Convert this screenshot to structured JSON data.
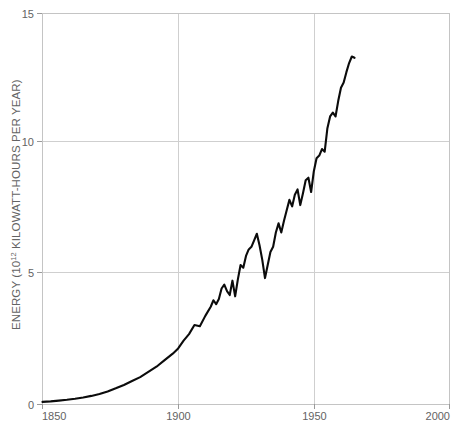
{
  "chart_data": {
    "type": "line",
    "title": "",
    "subtitle": "",
    "xlabel": "",
    "ylabel": "ENERGY (10",
    "ylabel_exponent": "12",
    "ylabel_tail": " KILOWATT-HOURS PER YEAR)",
    "ylabel_full": "ENERGY (10^12 KILOWATT-HOURS PER YEAR)",
    "grid": true,
    "legend": "none",
    "xlim": [
      1850,
      2000
    ],
    "ylim": [
      0,
      15
    ],
    "xticks": [
      1850,
      1900,
      1950,
      2000
    ],
    "xtick_labels": [
      "1850",
      "1900",
      "1950",
      "2000"
    ],
    "yticks": [
      0,
      5,
      10,
      15
    ],
    "ytick_labels": [
      "0",
      "5",
      "10",
      "15"
    ],
    "series": [
      {
        "name": "World energy consumption",
        "color": "#0b0b0b",
        "x": [
          1850,
          1853,
          1856,
          1859,
          1862,
          1865,
          1868,
          1871,
          1874,
          1877,
          1880,
          1883,
          1886,
          1889,
          1892,
          1895,
          1898,
          1900,
          1902,
          1904,
          1906,
          1908,
          1910,
          1912,
          1913,
          1914,
          1915,
          1916,
          1917,
          1918,
          1919,
          1920,
          1921,
          1922,
          1923,
          1924,
          1925,
          1926,
          1927,
          1928,
          1929,
          1930,
          1931,
          1932,
          1933,
          1934,
          1935,
          1936,
          1937,
          1938,
          1939,
          1940,
          1941,
          1942,
          1943,
          1944,
          1945,
          1946,
          1947,
          1948,
          1949,
          1950,
          1951,
          1952,
          1953,
          1954,
          1955,
          1956,
          1957,
          1958,
          1959,
          1960,
          1961,
          1962,
          1963,
          1964,
          1965
        ],
        "y": [
          0.1,
          0.12,
          0.15,
          0.18,
          0.22,
          0.27,
          0.33,
          0.4,
          0.5,
          0.62,
          0.75,
          0.9,
          1.05,
          1.25,
          1.45,
          1.7,
          1.95,
          2.15,
          2.45,
          2.7,
          3.05,
          3.0,
          3.4,
          3.75,
          4.0,
          3.85,
          4.05,
          4.45,
          4.6,
          4.35,
          4.2,
          4.75,
          4.15,
          4.8,
          5.35,
          5.25,
          5.7,
          5.95,
          6.05,
          6.3,
          6.55,
          6.1,
          5.55,
          4.85,
          5.35,
          5.85,
          6.05,
          6.6,
          6.95,
          6.6,
          7.05,
          7.45,
          7.85,
          7.6,
          8.05,
          8.25,
          7.65,
          8.1,
          8.6,
          8.7,
          8.15,
          8.95,
          9.45,
          9.55,
          9.8,
          9.7,
          10.6,
          11.05,
          11.2,
          11.05,
          11.65,
          12.15,
          12.35,
          12.75,
          13.1,
          13.35,
          13.3
        ]
      }
    ],
    "annotations": []
  },
  "axes": {
    "y_axis_name": "energy-axis",
    "x_axis_name": "year-axis"
  },
  "colors": {
    "line": "#0b0b0b",
    "grid": "#cfcfcf",
    "frame": "#c4c4c4",
    "text": "#636363",
    "background": "#ffffff"
  }
}
